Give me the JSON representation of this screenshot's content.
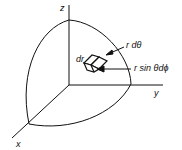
{
  "diagram": {
    "type": "spherical-coordinates-volume-element",
    "axes": {
      "x": "x",
      "y": "y",
      "z": "z"
    },
    "labels": {
      "dr": "dr",
      "r_dtheta": "r dθ",
      "r_sin_theta_dphi": "r sin θdϕ"
    },
    "colors": {
      "stroke": "#111111",
      "background": "#ffffff"
    }
  }
}
